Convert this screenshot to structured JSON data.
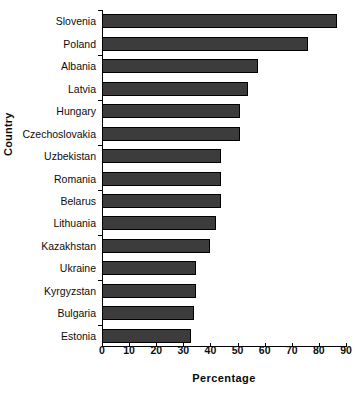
{
  "chart_data": {
    "type": "bar",
    "orientation": "horizontal",
    "title": "",
    "xlabel": "Percentage",
    "ylabel": "Country",
    "xlim": [
      0,
      90
    ],
    "xticks": [
      0,
      10,
      20,
      30,
      40,
      50,
      60,
      70,
      80,
      90
    ],
    "grid": false,
    "legend": null,
    "bar_color": "#3c3c3c",
    "bar_edge_color": "#000000",
    "categories": [
      "Slovenia",
      "Poland",
      "Albania",
      "Latvia",
      "Hungary",
      "Czechoslovakia",
      "Uzbekistan",
      "Romania",
      "Belarus",
      "Lithuania",
      "Kazakhstan",
      "Ukraine",
      "Kyrgyzstan",
      "Bulgaria",
      "Estonia"
    ],
    "values": [
      86.5,
      76,
      57.5,
      54,
      51,
      51,
      44,
      44,
      44,
      42,
      40,
      34.5,
      34.5,
      34,
      33
    ]
  }
}
